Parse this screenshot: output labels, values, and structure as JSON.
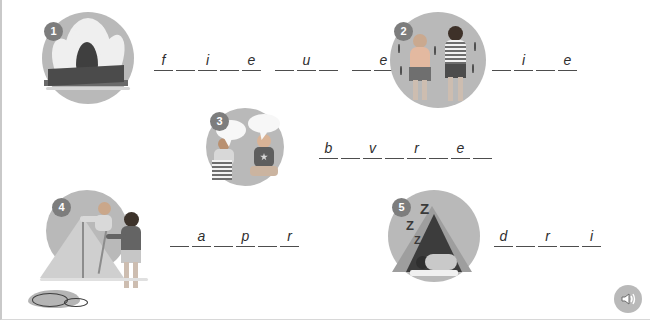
{
  "worksheet": {
    "title": "Camping vocabulary fill-in-the-blanks worksheet",
    "background_color": "#ffffff",
    "accent_color": "#b9b9b9",
    "badge_color": "#7d7d7d",
    "line_color": "#4d4d4d"
  },
  "items": [
    {
      "number": "1",
      "illustration": "campfire-illustration",
      "illustration_alt": "campfire burning on logs",
      "groups": [
        {
          "letters": [
            "f",
            "",
            "i",
            "",
            "e"
          ]
        },
        {
          "letters": [
            "",
            "u",
            ""
          ]
        },
        {
          "letters": [
            "",
            "e",
            ""
          ]
        }
      ]
    },
    {
      "number": "2",
      "illustration": "shivering-people-illustration",
      "illustration_alt": "two people shivering in the cold",
      "groups": [
        {
          "letters": [
            "",
            "i",
            "",
            "e"
          ]
        }
      ]
    },
    {
      "number": "3",
      "illustration": "talking-people-illustration",
      "illustration_alt": "two people talking with speech bubbles",
      "groups": [
        {
          "letters": [
            "b",
            "",
            "v",
            "",
            "r",
            "",
            "e",
            ""
          ]
        }
      ]
    },
    {
      "number": "4",
      "illustration": "pitching-tent-illustration",
      "illustration_alt": "two people pitching a tent",
      "groups": [
        {
          "letters": [
            "",
            "a",
            "",
            "p",
            "",
            "r"
          ]
        }
      ]
    },
    {
      "number": "5",
      "illustration": "sleeping-in-tent-illustration",
      "illustration_alt": "person sleeping in a tent with Z Z Z",
      "zzz": [
        "Z",
        "Z",
        "Z"
      ],
      "groups": [
        {
          "letters": [
            "d",
            "",
            "r",
            "",
            "i"
          ]
        }
      ]
    }
  ],
  "decorations": {
    "sandal": "sandal-illustration"
  },
  "controls": {
    "audio_button": "speaker-icon",
    "audio_label": "Play audio"
  }
}
